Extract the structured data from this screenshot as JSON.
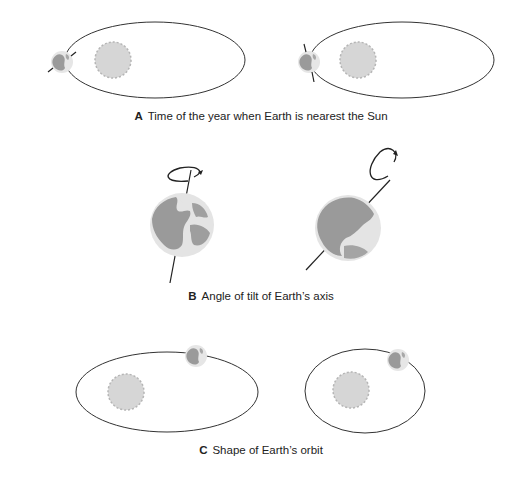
{
  "panels": [
    {
      "letter": "A",
      "caption": "Time of the year when Earth is nearest the Sun",
      "description": "Two elliptical orbits with Sun near one focus; Earth at perihelion with axis tilted differently in each."
    },
    {
      "letter": "B",
      "caption": "Angle of tilt of Earth’s axis",
      "description": "Two globes with rotation arrows; axis nearly vertical on left, strongly tilted on right."
    },
    {
      "letter": "C",
      "caption": "Shape of Earth’s orbit",
      "description": "Elongated elliptical orbit on left, nearly circular orbit on right, each with Sun and Earth."
    }
  ],
  "colors": {
    "orbit": "#333333",
    "sun": "#d3d3d3",
    "earth_ocean": "#e4e4e4",
    "earth_land": "#9a9a9a",
    "axis": "#222222",
    "text": "#222222"
  }
}
